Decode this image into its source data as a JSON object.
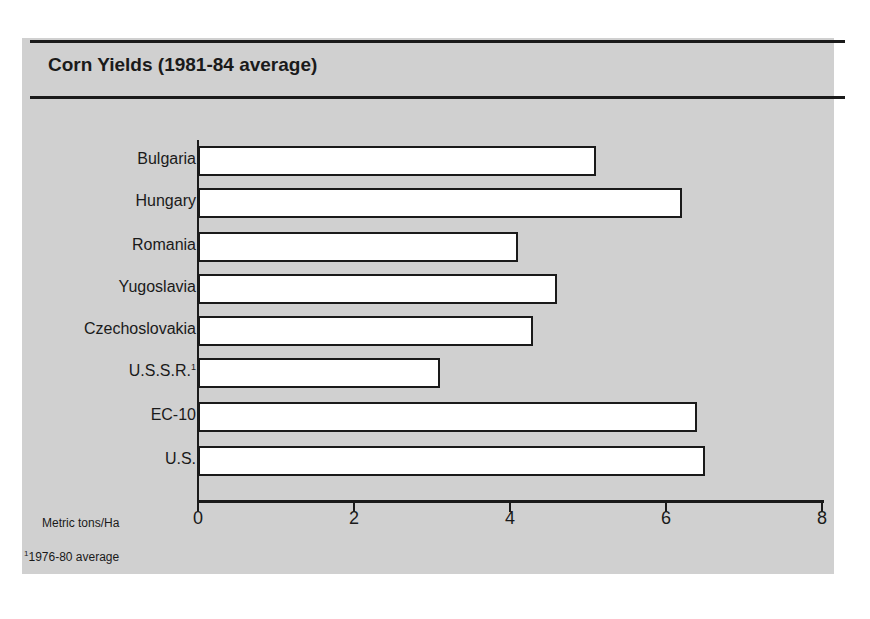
{
  "chart_data": {
    "type": "bar",
    "orientation": "horizontal",
    "title": "Corn Yields (1981-84 average)",
    "xlabel": "Metric tons/Ha",
    "ylabel": "",
    "categories": [
      "Bulgaria",
      "Hungary",
      "Romania",
      "Yugoslavia",
      "Czechoslovakia",
      "U.S.S.R.",
      "EC-10",
      "U.S."
    ],
    "values": [
      5.1,
      6.2,
      4.1,
      4.6,
      4.3,
      3.1,
      6.4,
      6.5
    ],
    "xlim": [
      0,
      8
    ],
    "xticks": [
      "0",
      "2",
      "4",
      "6",
      "8"
    ],
    "grid": false,
    "legend": null,
    "annotations": [
      "1 = 1976-80 average (U.S.S.R.)"
    ]
  },
  "labels": {
    "title": "Corn Yields (1981-84 average)",
    "unit": "Metric tons/Ha",
    "footnote_mark": "1",
    "footnote_text": "1976-80 average",
    "ussr_mark": "1"
  },
  "bars": [
    {
      "label": "Bulgaria",
      "value": 5.1
    },
    {
      "label": "Hungary",
      "value": 6.2
    },
    {
      "label": "Romania",
      "value": 4.1
    },
    {
      "label": "Yugoslavia",
      "value": 4.6
    },
    {
      "label": "Czechoslovakia",
      "value": 4.3
    },
    {
      "label": "U.S.S.R.",
      "value": 3.1
    },
    {
      "label": "EC-10",
      "value": 6.4
    },
    {
      "label": "U.S.",
      "value": 6.5
    }
  ],
  "ticks": [
    "0",
    "2",
    "4",
    "6",
    "8"
  ],
  "colors": {
    "panel": "#d0d0d0",
    "bar_fill": "#ffffff",
    "ink": "#1a1a1a"
  }
}
